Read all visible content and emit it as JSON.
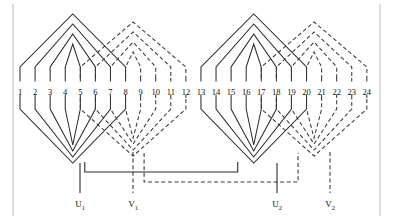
{
  "figure": {
    "kind": "stator-winding-diagram",
    "total_slots": 24,
    "groups": 2,
    "phases": [
      {
        "name": "U",
        "line_style": "solid",
        "color": "#2b2b2b"
      },
      {
        "name": "V",
        "line_style": "dashed",
        "color": "#3a3a3a"
      }
    ]
  },
  "border": {
    "left_x": 13,
    "right_x": 380,
    "color": "#b9b9b9"
  },
  "slots": {
    "labels": [
      "1",
      "2",
      "3",
      "4",
      "5",
      "6",
      "7",
      "8",
      "9",
      "10",
      "11",
      "12",
      "13",
      "14",
      "15",
      "16",
      "17",
      "18",
      "19",
      "20",
      "21",
      "22",
      "23",
      "24"
    ],
    "label_y": 88,
    "first_x": 20,
    "pitch": 15.08
  },
  "terminals": [
    {
      "id": "U1",
      "letter": "U",
      "index": "1",
      "x": 80,
      "label_y": 200,
      "style": "solid"
    },
    {
      "id": "V1",
      "letter": "V",
      "index": "1",
      "x": 133,
      "label_y": 200,
      "style": "dashed"
    },
    {
      "id": "U2",
      "letter": "U",
      "index": "2",
      "x": 277,
      "label_y": 200,
      "style": "solid"
    },
    {
      "id": "V2",
      "letter": "V",
      "index": "2",
      "x": 330,
      "label_y": 200,
      "style": "dashed"
    }
  ],
  "geometry": {
    "slot_top_y": 78,
    "slot_bottom_y": 98,
    "bevel": 11,
    "group_offsets": [
      0,
      181
    ],
    "solid_coils": [
      {
        "a": 1,
        "b": 8,
        "apex_top": 14,
        "apex_bot": 163
      },
      {
        "a": 2,
        "b": 7,
        "apex_top": 24,
        "apex_bot": 157
      },
      {
        "a": 3,
        "b": 6,
        "apex_top": 34,
        "apex_bot": 151
      },
      {
        "a": 4,
        "b": 5,
        "apex_top": 44,
        "apex_bot": 145
      }
    ],
    "dashed_coils": [
      {
        "a": 5,
        "b": 12,
        "apex_top": 22,
        "apex_bot": 156
      },
      {
        "a": 6,
        "b": 11,
        "apex_top": 32,
        "apex_bot": 150
      },
      {
        "a": 7,
        "b": 10,
        "apex_top": 42,
        "apex_bot": 144
      },
      {
        "a": 8,
        "b": 9,
        "apex_top": 52,
        "apex_bot": 138
      }
    ],
    "solid_outer_to_slot9": true,
    "bus_y_solid": 172,
    "bus_y_dashed": 182,
    "lead_bottom_y": 193
  }
}
